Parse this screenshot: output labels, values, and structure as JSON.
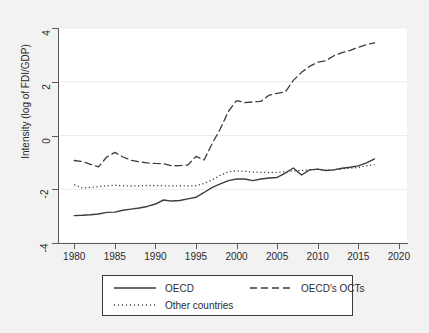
{
  "chart_data": {
    "type": "line",
    "title": "",
    "subtitle": "",
    "xlabel": "",
    "ylabel": "Intensity (log of FDI/GDP)",
    "xlim": [
      1978,
      2021
    ],
    "ylim": [
      -4,
      4
    ],
    "xticks": [
      1980,
      1985,
      1990,
      1995,
      2000,
      2005,
      2010,
      2015,
      2020
    ],
    "xtick_labels": [
      "1980",
      "1985",
      "1990",
      "1995",
      "2000",
      "2005",
      "2010",
      "2015",
      "2020"
    ],
    "yticks": [
      -4,
      -2,
      0,
      2,
      4
    ],
    "ytick_labels": [
      "-4",
      "-2",
      "0",
      "2",
      "4"
    ],
    "grid": "horizontal",
    "legend_position": "below-plot",
    "x": [
      1980,
      1981,
      1982,
      1983,
      1984,
      1985,
      1986,
      1987,
      1988,
      1989,
      1990,
      1991,
      1992,
      1993,
      1994,
      1995,
      1996,
      1997,
      1998,
      1999,
      2000,
      2001,
      2002,
      2003,
      2004,
      2005,
      2006,
      2007,
      2008,
      2009,
      2010,
      2011,
      2012,
      2013,
      2014,
      2015,
      2016,
      2017
    ],
    "series": [
      {
        "name": "OECD",
        "style": "solid",
        "color": "#3d3d3d",
        "values": [
          -2.98,
          -2.97,
          -2.95,
          -2.92,
          -2.86,
          -2.85,
          -2.78,
          -2.74,
          -2.7,
          -2.64,
          -2.55,
          -2.4,
          -2.44,
          -2.42,
          -2.36,
          -2.3,
          -2.12,
          -1.93,
          -1.8,
          -1.68,
          -1.62,
          -1.62,
          -1.68,
          -1.62,
          -1.58,
          -1.56,
          -1.4,
          -1.21,
          -1.47,
          -1.28,
          -1.25,
          -1.3,
          -1.28,
          -1.22,
          -1.18,
          -1.13,
          -1.02,
          -0.87
        ]
      },
      {
        "name": "OECD's OCTs",
        "style": "dashed",
        "color": "#3d3d3d",
        "values": [
          -0.93,
          -0.97,
          -1.07,
          -1.17,
          -0.8,
          -0.63,
          -0.8,
          -0.92,
          -0.98,
          -1.02,
          -1.04,
          -1.05,
          -1.13,
          -1.12,
          -1.1,
          -0.78,
          -0.91,
          -0.3,
          0.25,
          0.9,
          1.3,
          1.22,
          1.25,
          1.27,
          1.5,
          1.57,
          1.62,
          2.05,
          2.35,
          2.57,
          2.73,
          2.78,
          2.97,
          3.08,
          3.17,
          3.28,
          3.38,
          3.45
        ]
      },
      {
        "name": "Other countries",
        "style": "dotted",
        "color": "#3d3d3d",
        "values": [
          -1.83,
          -1.95,
          -1.93,
          -1.9,
          -1.87,
          -1.85,
          -1.87,
          -1.88,
          -1.87,
          -1.86,
          -1.86,
          -1.87,
          -1.88,
          -1.87,
          -1.88,
          -1.87,
          -1.78,
          -1.65,
          -1.48,
          -1.35,
          -1.31,
          -1.33,
          -1.36,
          -1.37,
          -1.38,
          -1.37,
          -1.35,
          -1.32,
          -1.3,
          -1.28,
          -1.26,
          -1.3,
          -1.27,
          -1.24,
          -1.22,
          -1.19,
          -1.13,
          -1.08
        ]
      }
    ]
  },
  "legend": {
    "entries": [
      {
        "label": "OECD",
        "style": "solid"
      },
      {
        "label": "OECD's OCTs",
        "style": "dashed"
      },
      {
        "label": "Other countries",
        "style": "dotted"
      }
    ]
  },
  "colors": {
    "figure_background": "#f2f2f2",
    "plot_background": "#ffffff",
    "axis": "#5a5a5a",
    "gridline": "#ececec",
    "line": "#3d3d3d",
    "text": "#2b2b2b"
  }
}
